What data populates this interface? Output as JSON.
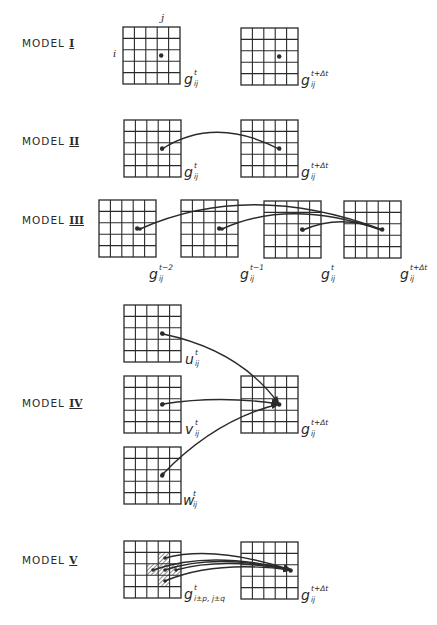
{
  "figure": {
    "width": 437,
    "height": 625,
    "line_color": "#2a2a2a",
    "background": "#ffffff",
    "grid_rows": 5,
    "grid_cols": 5,
    "grid_size": 57
  },
  "axis_labels": {
    "row": "i",
    "col": "j"
  },
  "models": [
    {
      "id": "model-1",
      "label": "MODEL",
      "numeral": "I",
      "label_pos": [
        22,
        38
      ],
      "grids": [
        {
          "x": 123,
          "y": 27,
          "label_base": "g",
          "label_sup": "t",
          "label_sub": "ij",
          "dot": [
            3,
            2
          ],
          "label_pos": [
            184,
            71
          ]
        },
        {
          "x": 241,
          "y": 28,
          "label_base": "g",
          "label_sup": "t+Δt",
          "label_sub": "ij",
          "dot": [
            3,
            2
          ],
          "label_pos": [
            301,
            72
          ]
        }
      ],
      "connections": []
    },
    {
      "id": "model-2",
      "label": "MODEL",
      "numeral": "II",
      "label_pos": [
        22,
        136
      ],
      "grids": [
        {
          "x": 124,
          "y": 120,
          "label_base": "g",
          "label_sup": "t",
          "label_sub": "ij",
          "dot": [
            3,
            2
          ],
          "label_pos": [
            184,
            164
          ]
        },
        {
          "x": 241,
          "y": 120,
          "label_base": "g",
          "label_sup": "t+Δt",
          "label_sub": "ij",
          "dot": [
            3,
            2
          ],
          "label_pos": [
            301,
            164
          ]
        }
      ],
      "connections": [
        {
          "from": [
            162,
            149
          ],
          "to": [
            281,
            150
          ],
          "ctrl": [
            215,
            115
          ],
          "arrow": false
        }
      ]
    },
    {
      "id": "model-3",
      "label": "MODEL",
      "numeral": "III",
      "label_pos": [
        22,
        215
      ],
      "grids": [
        {
          "x": 99,
          "y": 200,
          "label_base": "g",
          "label_sup": "t−2",
          "label_sub": "ij",
          "dot": [
            3,
            2
          ],
          "label_pos": [
            149,
            266
          ]
        },
        {
          "x": 181,
          "y": 200,
          "label_base": "g",
          "label_sup": "t−1",
          "label_sub": "ij",
          "dot": [
            3,
            2
          ],
          "label_pos": [
            240,
            266
          ]
        },
        {
          "x": 264,
          "y": 201,
          "label_base": "g",
          "label_sup": "t",
          "label_sub": "ij",
          "dot": [
            3,
            2
          ],
          "label_pos": [
            321,
            266
          ]
        },
        {
          "x": 344,
          "y": 201,
          "label_base": "g",
          "label_sup": "t+Δt",
          "label_sub": "ij",
          "dot": [
            3,
            2
          ],
          "label_pos": [
            400,
            266
          ]
        }
      ],
      "connections": [
        {
          "from": [
            140,
            229
          ],
          "to": [
            383,
            230
          ],
          "ctrl": [
            250,
            180
          ],
          "arrow": false
        },
        {
          "from": [
            222,
            229
          ],
          "to": [
            381,
            230
          ],
          "ctrl": [
            290,
            198
          ],
          "arrow": false
        },
        {
          "from": [
            303,
            230
          ],
          "to": [
            379,
            229
          ],
          "ctrl": [
            340,
            214
          ],
          "arrow": false
        }
      ]
    },
    {
      "id": "model-4",
      "label": "MODEL",
      "numeral": "IV",
      "label_pos": [
        22,
        398
      ],
      "grids": [
        {
          "x": 124,
          "y": 305,
          "label_base": "u",
          "label_sup": "t",
          "label_sub": "ij",
          "dot": [
            3,
            2
          ],
          "label_pos": [
            185,
            351
          ]
        },
        {
          "x": 124,
          "y": 376,
          "label_base": "v",
          "label_sup": "t",
          "label_sub": "ij",
          "dot": [
            3,
            2
          ],
          "label_pos": [
            185,
            421
          ]
        },
        {
          "x": 124,
          "y": 447,
          "label_base": "w",
          "label_sup": "t",
          "label_sub": "ij",
          "dot": [
            3,
            2
          ],
          "label_pos": [
            183,
            492
          ]
        },
        {
          "x": 241,
          "y": 376,
          "label_base": "g",
          "label_sup": "t+Δt",
          "label_sub": "ij",
          "dot": [
            3,
            2
          ],
          "label_pos": [
            301,
            421
          ]
        }
      ],
      "connections": [
        {
          "from": [
            163,
            334
          ],
          "to": [
            279,
            404
          ],
          "ctrl": [
            240,
            350
          ],
          "arrow": true
        },
        {
          "from": [
            163,
            404
          ],
          "to": [
            279,
            404
          ],
          "ctrl": [
            220,
            395
          ],
          "arrow": true
        },
        {
          "from": [
            163,
            474
          ],
          "to": [
            279,
            404
          ],
          "ctrl": [
            215,
            420
          ],
          "arrow": true
        }
      ]
    },
    {
      "id": "model-5",
      "label": "MODEL",
      "numeral": "V",
      "label_pos": [
        22,
        555
      ],
      "grids": [
        {
          "x": 124,
          "y": 541,
          "label_base": "g",
          "label_sup": "t",
          "label_sub": "i±p, j±q",
          "dot": null,
          "hatched": [
            [
              1,
              3
            ],
            [
              2,
              2
            ],
            [
              2,
              3
            ],
            [
              2,
              4
            ],
            [
              3,
              3
            ]
          ],
          "label_pos": [
            184,
            586
          ]
        },
        {
          "x": 241,
          "y": 542,
          "label_base": "g",
          "label_sup": "t+Δt",
          "label_sub": "ij",
          "dot": [
            4,
            2
          ],
          "label_pos": [
            301,
            587
          ]
        }
      ],
      "connections": [
        {
          "from": [
            165,
            558
          ],
          "to": [
            291,
            570
          ],
          "ctrl": [
            215,
            545
          ],
          "arrow": true
        },
        {
          "from": [
            153,
            570
          ],
          "to": [
            291,
            570
          ],
          "ctrl": [
            210,
            550
          ],
          "arrow": true
        },
        {
          "from": [
            165,
            570
          ],
          "to": [
            291,
            570
          ],
          "ctrl": [
            215,
            553
          ],
          "arrow": true
        },
        {
          "from": [
            176,
            570
          ],
          "to": [
            291,
            570
          ],
          "ctrl": [
            222,
            557
          ],
          "arrow": true
        },
        {
          "from": [
            165,
            581
          ],
          "to": [
            291,
            570
          ],
          "ctrl": [
            215,
            560
          ],
          "arrow": true
        }
      ]
    }
  ]
}
